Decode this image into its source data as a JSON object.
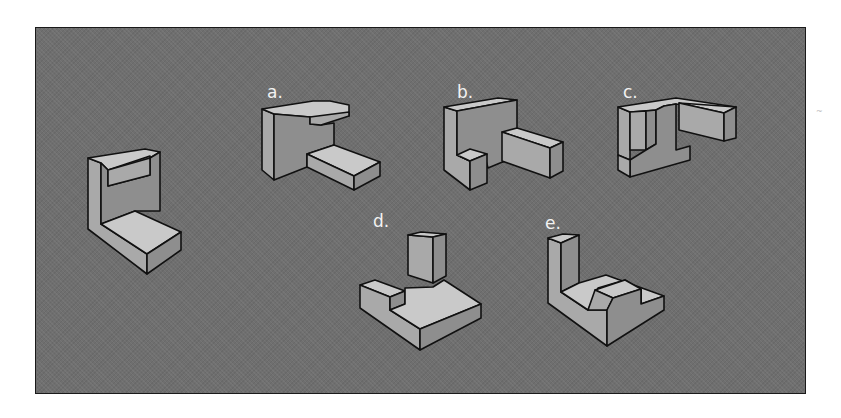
{
  "figure": {
    "panel": {
      "background": "#6f6f6f",
      "border": "#1a1a1a"
    },
    "shade": {
      "light": "#c9c9c9",
      "mid": "#a9a9a9",
      "dark": "#8e8e8e",
      "stroke": "#111111"
    },
    "options": [
      {
        "id": "a",
        "label": "a.",
        "x": 267,
        "y": 84
      },
      {
        "id": "b",
        "label": "b.",
        "x": 457,
        "y": 84
      },
      {
        "id": "c",
        "label": "c.",
        "x": 623,
        "y": 84
      },
      {
        "id": "d",
        "label": "d.",
        "x": 373,
        "y": 213
      },
      {
        "id": "e",
        "label": "e.",
        "x": 545,
        "y": 215
      }
    ],
    "shapes": [
      {
        "name": "reference-shape",
        "faces": [
          {
            "tone": "mid",
            "pts": "88,158 101,163 101,224 147,254 147,274 88,229"
          },
          {
            "tone": "light",
            "pts": "88,158 145,149 160,152 150,158 150,156 108,170 101,163"
          },
          {
            "tone": "dark",
            "pts": "101,163 108,170 108,186 150,175 150,158 160,152 160,211 135,211 101,224"
          },
          {
            "tone": "mid",
            "pts": "108,170 150,158 150,175 108,186"
          },
          {
            "tone": "light",
            "pts": "101,224 135,211 181,232 147,254"
          },
          {
            "tone": "dark",
            "pts": "147,254 181,232 181,250 147,274"
          }
        ]
      },
      {
        "name": "option-a-shape",
        "faces": [
          {
            "tone": "mid",
            "pts": "262,109 274,114 274,180 262,170"
          },
          {
            "tone": "light",
            "pts": "262,109 313,101 330,101 349,105 349,116 313,120 310,117 274,114"
          },
          {
            "tone": "dark",
            "pts": "274,114 310,117 310,124 321,125 334,123 334,145 307,154 307,167 274,180"
          },
          {
            "tone": "mid",
            "pts": "310,117 349,112 349,116 321,125 310,124"
          },
          {
            "tone": "light",
            "pts": "307,154 334,145 380,162 354,176"
          },
          {
            "tone": "mid",
            "pts": "307,154 354,176 354,190 307,167"
          },
          {
            "tone": "dark",
            "pts": "354,176 380,162 380,176 354,190"
          }
        ]
      },
      {
        "name": "option-b-shape",
        "faces": [
          {
            "tone": "mid",
            "pts": "444,107 457,111 457,155 470,161 470,190 444,170"
          },
          {
            "tone": "light",
            "pts": "444,107 498,98 517,100 457,111"
          },
          {
            "tone": "dark",
            "pts": "457,111 517,100 517,157 500,163 488,168 485,157 470,161 457,155"
          },
          {
            "tone": "light",
            "pts": "457,155 470,149 487,154 470,161"
          },
          {
            "tone": "dark",
            "pts": "470,161 487,154 487,183 470,190"
          },
          {
            "tone": "light",
            "pts": "502,132 517,128 563,142 550,148"
          },
          {
            "tone": "mid",
            "pts": "502,132 550,148 550,178 502,161"
          },
          {
            "tone": "dark",
            "pts": "550,148 563,142 563,171 550,178"
          }
        ]
      },
      {
        "name": "option-c-shape",
        "faces": [
          {
            "tone": "mid",
            "pts": "618,107 630,112 630,160 618,155"
          },
          {
            "tone": "light",
            "pts": "618,107 676,98 736,107 724,112 676,104 664,106 656,110 630,112"
          },
          {
            "tone": "mid",
            "pts": "630,112 646,111 646,150 630,150"
          },
          {
            "tone": "dark",
            "pts": "646,111 656,110 656,144 646,150"
          },
          {
            "tone": "dark",
            "pts": "656,110 664,106 676,104 676,150 690,146 690,160 630,177 630,160 646,150 656,144"
          },
          {
            "tone": "mid",
            "pts": "618,155 630,160 630,177 618,170"
          },
          {
            "tone": "light",
            "pts": "679,103 736,107 724,113"
          },
          {
            "tone": "mid",
            "pts": "679,103 724,113 724,141 679,130"
          },
          {
            "tone": "dark",
            "pts": "724,113 736,107 736,138 724,141"
          }
        ]
      },
      {
        "name": "option-d-shape",
        "faces": [
          {
            "tone": "light",
            "pts": "360,285 375,280 405,291 390,297"
          },
          {
            "tone": "mid",
            "pts": "360,285 390,297 390,310 420,329 420,350 360,308"
          },
          {
            "tone": "dark",
            "pts": "390,297 405,291 405,304 390,310"
          },
          {
            "tone": "light",
            "pts": "390,310 405,304 405,288 433,287 444,280 481,304 420,329"
          },
          {
            "tone": "dark",
            "pts": "420,329 481,304 481,318 420,350"
          },
          {
            "tone": "mid",
            "pts": "408,235 433,237 433,283 408,275"
          },
          {
            "tone": "light",
            "pts": "408,235 421,232 446,234 433,237"
          },
          {
            "tone": "dark",
            "pts": "433,237 446,234 446,276 433,283"
          }
        ]
      },
      {
        "name": "option-e-shape",
        "faces": [
          {
            "tone": "mid",
            "pts": "548,238 561,243 561,292 588,310 607,310 607,346 548,303"
          },
          {
            "tone": "light",
            "pts": "548,238 563,234 579,235 561,243"
          },
          {
            "tone": "dark",
            "pts": "561,243 579,235 579,283 561,292"
          },
          {
            "tone": "light",
            "pts": "561,292 579,283 606,275 664,296 641,304 641,290 625,280 598,288 588,310"
          },
          {
            "tone": "light",
            "pts": "595,290 625,280 641,289 613,298"
          },
          {
            "tone": "mid",
            "pts": "588,310 595,290 613,298 607,310"
          },
          {
            "tone": "mid",
            "pts": "641,290 641,304 631,309 631,295"
          },
          {
            "tone": "dark",
            "pts": "607,310 613,298 641,289 641,304 664,296 664,310 607,346"
          }
        ]
      }
    ]
  }
}
